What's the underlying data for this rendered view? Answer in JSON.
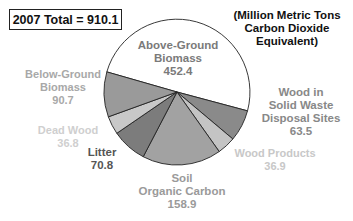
{
  "chart_data": {
    "type": "pie",
    "title": "2007 Total = 910.1",
    "subtitle": "(Million Metric Tons Carbon Dioxide Equivalent)",
    "total": 910.1,
    "units": "Million Metric Tons Carbon Dioxide Equivalent",
    "slices": [
      {
        "name": "Above-Ground Biomass",
        "value": 452.4,
        "color": "#ffffff",
        "label_color": "#7a7a7a",
        "label_lines": [
          "Above-Ground",
          "Biomass",
          "452.4"
        ]
      },
      {
        "name": "Wood in Solid Waste Disposal Sites",
        "value": 63.5,
        "color": "#8a8a8a",
        "label_color": "#8a8a8a",
        "label_lines": [
          "Wood in",
          "Solid Waste",
          "Disposal Sites",
          "63.5"
        ]
      },
      {
        "name": "Wood Products",
        "value": 36.9,
        "color": "#c4c4c4",
        "label_color": "#c8c8c8",
        "label_lines": [
          "Wood Products",
          "36.9"
        ]
      },
      {
        "name": "Soil Organic Carbon",
        "value": 158.9,
        "color": "#a2a2a2",
        "label_color": "#9a9a9a",
        "label_lines": [
          "Soil",
          "Organic Carbon",
          "158.9"
        ]
      },
      {
        "name": "Litter",
        "value": 70.8,
        "color": "#7c7c7c",
        "label_color": "#555555",
        "label_lines": [
          "Litter",
          "70.8"
        ]
      },
      {
        "name": "Dead Wood",
        "value": 36.8,
        "color": "#c8c8c8",
        "label_color": "#cfcfcf",
        "label_lines": [
          "Dead Wood",
          "36.8"
        ]
      },
      {
        "name": "Below-Ground Biomass",
        "value": 90.7,
        "color": "#9a9a9a",
        "label_color": "#a8a8a8",
        "label_lines": [
          "Below-Ground",
          "Biomass",
          "90.7"
        ]
      }
    ],
    "legend": "none (direct labels)"
  },
  "labels": {
    "total_box": "2007 Total = 910.1",
    "units": [
      "(Million Metric Tons",
      "Carbon Dioxide",
      "Equivalent)"
    ],
    "above_ground": [
      "Above-Ground",
      "Biomass",
      "452.4"
    ],
    "wood_swds": [
      "Wood in",
      "Solid Waste",
      "Disposal Sites",
      "63.5"
    ],
    "wood_products": [
      "Wood Products",
      "36.9"
    ],
    "soil": [
      "Soil",
      "Organic Carbon",
      "158.9"
    ],
    "litter": [
      "Litter",
      "70.8"
    ],
    "dead_wood": [
      "Dead Wood",
      "36.8"
    ],
    "below_ground": [
      "Below-Ground",
      "Biomass",
      "90.7"
    ]
  }
}
